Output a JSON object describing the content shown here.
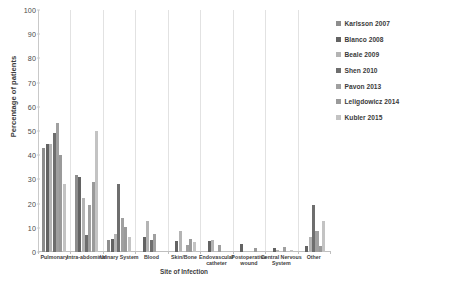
{
  "chart": {
    "type": "bar",
    "y_axis_title": "Percentage of patients",
    "x_axis_title": "Site of Infection"
  },
  "axis": {
    "y_ticks": [
      "0",
      "10",
      "20",
      "30",
      "40",
      "50",
      "60",
      "70",
      "80",
      "90",
      "100"
    ],
    "y_min": 0,
    "y_max": 100
  },
  "legend": {
    "items": [
      {
        "label": "Karlsson 2007",
        "color": "#8d8d8d"
      },
      {
        "label": "Blanco 2008",
        "color": "#636363"
      },
      {
        "label": "Beale 2009",
        "color": "#b4b4b4"
      },
      {
        "label": "Shen 2010",
        "color": "#6e6e6e"
      },
      {
        "label": "Pavon 2013",
        "color": "#a0a0a0"
      },
      {
        "label": "Leligdowicz 2014",
        "color": "#9a9a9a"
      },
      {
        "label": "Kubler 2015",
        "color": "#c3c3c3"
      }
    ]
  },
  "chart_data": {
    "type": "bar",
    "title": "",
    "xlabel": "Site of Infection",
    "ylabel": "Percentage of patients",
    "ylim": [
      0,
      100
    ],
    "ytick_step": 10,
    "grid": false,
    "legend_position": "right",
    "categories": [
      "Pulmonary",
      "Intra-abdominal",
      "Urinary System",
      "Blood",
      "Skin/Bone",
      "Endovascular catheter",
      "Postoperative wound",
      "Central Nervous System",
      "Other"
    ],
    "series": [
      {
        "name": "Karlsson 2007",
        "color": "#8d8d8d",
        "values": [
          43.0,
          32.0,
          5.0,
          0.0,
          0.0,
          0.0,
          0.0,
          0.0,
          0.0
        ]
      },
      {
        "name": "Blanco 2008",
        "color": "#636363",
        "values": [
          44.5,
          31.0,
          5.5,
          6.0,
          4.5,
          4.5,
          3.5,
          1.5,
          2.5
        ]
      },
      {
        "name": "Beale 2009",
        "color": "#b4b4b4",
        "values": [
          44.5,
          22.5,
          7.5,
          13.0,
          8.5,
          5.0,
          0.0,
          1.0,
          6.0
        ]
      },
      {
        "name": "Shen 2010",
        "color": "#6e6e6e",
        "values": [
          49.0,
          7.0,
          28.0,
          5.0,
          0.0,
          0.0,
          0.0,
          0.0,
          19.5
        ]
      },
      {
        "name": "Pavon 2013",
        "color": "#a0a0a0",
        "values": [
          53.5,
          19.5,
          14.0,
          7.5,
          3.0,
          3.0,
          0.0,
          2.0,
          8.5
        ]
      },
      {
        "name": "Leligdowicz 2014",
        "color": "#9a9a9a",
        "values": [
          40.0,
          29.0,
          10.5,
          0.0,
          5.5,
          0.0,
          1.5,
          0.0,
          2.5
        ]
      },
      {
        "name": "Kubler 2015",
        "color": "#c3c3c3",
        "values": [
          28.0,
          50.0,
          6.0,
          0.0,
          4.0,
          0.0,
          0.0,
          1.0,
          13.0
        ]
      }
    ]
  }
}
